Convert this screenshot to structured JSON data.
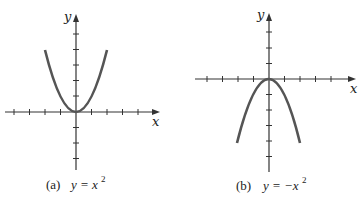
{
  "figures": [
    {
      "id": "a",
      "caption_letter": "(a)",
      "caption_eq": "y = x",
      "caption_exp": "2",
      "x_label": "x",
      "y_label": "y",
      "function": "y = x^2"
    },
    {
      "id": "b",
      "caption_letter": "(b)",
      "caption_eq": "y = −x",
      "caption_exp": "2",
      "x_label": "x",
      "y_label": "y",
      "function": "y = -x^2"
    }
  ],
  "colors": {
    "curve": "#555555",
    "axis": "#333333"
  }
}
